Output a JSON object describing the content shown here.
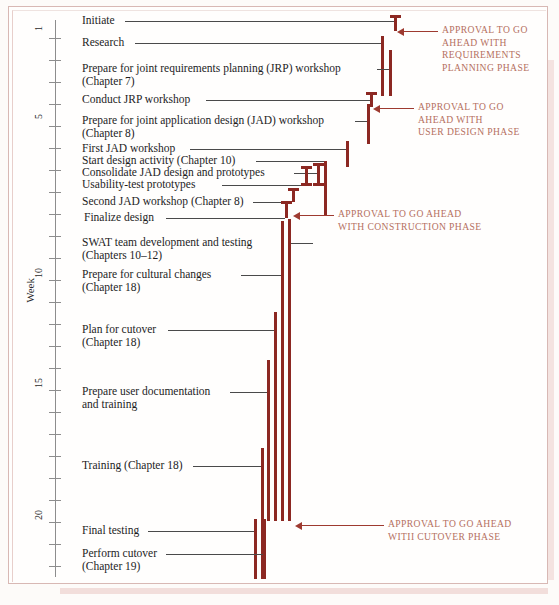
{
  "chart_data": {
    "type": "bar",
    "title": "",
    "xlabel": "",
    "ylabel": "Week",
    "ylim": [
      0,
      23
    ],
    "grid": false,
    "orientation": "vertical-timeline",
    "axis": {
      "label": "Week",
      "tick_labels": [
        "1",
        "5",
        "10",
        "15",
        "20"
      ],
      "tick_values": [
        1,
        5,
        10,
        15,
        20
      ],
      "minor_ticks_every": 1,
      "week_min": 0,
      "week_max": 23
    },
    "bar_color": "#8c2822",
    "leader_color": "#4a4a4a",
    "annotation_color": "#b5705f",
    "categories": [
      "Initiate",
      "Research",
      "Prepare for joint requirements planning (JRP) workshop (Chapter 7)",
      "Conduct JRP workshop",
      "Prepare for joint application design (JAD) workshop (Chapter 8)",
      "First JAD workshop",
      "Start design activity (Chapter 10)",
      "Consolidate JAD design and prototypes",
      "Usability-test prototypes",
      "Second JAD workshop (Chapter 8)",
      "Finalize design",
      "SWAT team development and testing (Chapters 10–12)",
      "Prepare for cultural changes (Chapter 18)",
      "Plan for cutover (Chapter 18)",
      "Prepare user documentation and training",
      "Training (Chapter 18)",
      "Final testing",
      "Perform cutover (Chapter 19)"
    ],
    "tasks": [
      {
        "label": "Initiate",
        "lines": [
          "Initiate"
        ],
        "start_week": 0.6,
        "end_week": 1.1
      },
      {
        "label": "Research",
        "lines": [
          "Research"
        ],
        "start_week": 1.0,
        "end_week": 3.2
      },
      {
        "label": "Prepare for JRP workshop",
        "lines": [
          "Prepare for joint requirements planning (JRP) workshop",
          "(Chapter 7)"
        ],
        "start_week": 1.6,
        "end_week": 3.2
      },
      {
        "label": "Conduct JRP workshop",
        "lines": [
          "Conduct JRP workshop"
        ],
        "start_week": 3.4,
        "end_week": 3.8
      },
      {
        "label": "Prepare for JAD workshop",
        "lines": [
          "Prepare for joint application design (JAD) workshop",
          "(Chapter 8)"
        ],
        "start_week": 3.7,
        "end_week": 5.2
      },
      {
        "label": "First JAD workshop",
        "lines": [
          "First JAD workshop"
        ],
        "start_week": 5.3,
        "end_week": 6.2
      },
      {
        "label": "Start design activity",
        "lines": [
          "Start design activity (Chapter 10)"
        ],
        "start_week": 6.1,
        "end_week": 8.6
      },
      {
        "label": "Consolidate JAD design and prototypes",
        "lines": [
          "Consolidate JAD design and prototypes"
        ],
        "start_week": 6.9,
        "end_week": 7.6
      },
      {
        "label": "Usability-test prototypes",
        "lines": [
          "Usability-test prototypes"
        ],
        "start_week": 7.4,
        "end_week": 7.9
      },
      {
        "label": "Second JAD workshop",
        "lines": [
          "Second JAD workshop (Chapter 8)"
        ],
        "start_week": 8.1,
        "end_week": 8.5
      },
      {
        "label": "Finalize design",
        "lines": [
          "Finalize design"
        ],
        "start_week": 8.3,
        "end_week": 8.8
      },
      {
        "label": "SWAT team development and testing",
        "lines": [
          "SWAT team development and testing",
          "(Chapters 10–12)"
        ],
        "start_week": 8.8,
        "end_week": 21.5
      },
      {
        "label": "Prepare for cultural changes",
        "lines": [
          "Prepare for cultural changes",
          "(Chapter 18)"
        ],
        "start_week": 8.9,
        "end_week": 21.4
      },
      {
        "label": "Plan for cutover",
        "lines": [
          "Plan for cutover",
          "(Chapter 18)"
        ],
        "start_week": 12.9,
        "end_week": 21.4
      },
      {
        "label": "Prepare user documentation and training",
        "lines": [
          "Prepare user documentation",
          "and training"
        ],
        "start_week": 15.1,
        "end_week": 21.4
      },
      {
        "label": "Training",
        "lines": [
          "Training (Chapter 18)"
        ],
        "start_week": 18.6,
        "end_week": 22.9
      },
      {
        "label": "Final testing",
        "lines": [
          "Final testing"
        ],
        "start_week": 21.0,
        "end_week": 22.9
      },
      {
        "label": "Perform cutover",
        "lines": [
          "Perform cutover",
          "(Chapter 19)"
        ],
        "start_week": 21.3,
        "end_week": 22.9
      }
    ],
    "annotations": [
      {
        "id": "requirements-planning",
        "text": "APPROVAL TO GO\nAHEAD WITH\nREQUIREMENTS\nPLANNING PHASE",
        "milestone_week": 1.1
      },
      {
        "id": "user-design",
        "text": "APPROVAL TO GO\nAHEAD WITH\nUSER DESIGN PHASE",
        "milestone_week": 3.8
      },
      {
        "id": "construction",
        "text": "APPROVAL TO GO AHEAD\nWITH CONSTRUCTION PHASE",
        "milestone_week": 8.8
      },
      {
        "id": "cutover",
        "text": "APPROVAL TO GO AHEAD\nWITII CUTOVER PHASE",
        "milestone_week": 21.5
      }
    ]
  },
  "axis": {
    "title": "Week",
    "ticks": [
      {
        "label": "1",
        "y": 38
      },
      {
        "label": "",
        "y": 60
      },
      {
        "label": "",
        "y": 82
      },
      {
        "label": "",
        "y": 104
      },
      {
        "label": "5",
        "y": 126
      },
      {
        "label": "",
        "y": 148
      },
      {
        "label": "",
        "y": 170
      },
      {
        "label": "",
        "y": 192
      },
      {
        "label": "",
        "y": 214
      },
      {
        "label": "",
        "y": 236
      },
      {
        "label": "10",
        "y": 280
      },
      {
        "label": "",
        "y": 258
      },
      {
        "label": "",
        "y": 302
      },
      {
        "label": "",
        "y": 324
      },
      {
        "label": "",
        "y": 346
      },
      {
        "label": "15",
        "y": 390
      },
      {
        "label": "",
        "y": 368
      },
      {
        "label": "",
        "y": 412
      },
      {
        "label": "",
        "y": 434
      },
      {
        "label": "",
        "y": 456
      },
      {
        "label": "",
        "y": 478
      },
      {
        "label": "20",
        "y": 522
      },
      {
        "label": "",
        "y": 500
      },
      {
        "label": "",
        "y": 544
      },
      {
        "label": "",
        "y": 566
      }
    ]
  },
  "tasks": [
    {
      "id": "initiate",
      "lines": [
        "Initiate"
      ],
      "text_x": 82,
      "text_y": 14,
      "leader_x": 125,
      "leader_w": 269,
      "leader_y": 21,
      "bar_x": 394,
      "bar_y": 15,
      "bar_h": 16,
      "cap_top": true,
      "cap_bottom": false
    },
    {
      "id": "research",
      "lines": [
        "Research"
      ],
      "text_x": 82,
      "text_y": 36,
      "leader_x": 135,
      "leader_w": 246,
      "leader_y": 43,
      "bar_x": 381,
      "bar_y": 36,
      "bar_h": 60,
      "cap_top": false,
      "cap_bottom": false
    },
    {
      "id": "prepare-jrp",
      "lines": [
        "Prepare for joint requirements planning (JRP) workshop",
        "(Chapter 7)"
      ],
      "text_x": 82,
      "text_y": 62,
      "leader_x": 377,
      "leader_w": 12,
      "leader_y": 69,
      "bar_x": 389,
      "bar_y": 50,
      "bar_h": 46,
      "cap_top": false,
      "cap_bottom": false
    },
    {
      "id": "conduct-jrp",
      "lines": [
        "Conduct JRP workshop"
      ],
      "text_x": 82,
      "text_y": 93,
      "leader_x": 206,
      "leader_w": 164,
      "leader_y": 100,
      "bar_x": 370,
      "bar_y": 92,
      "bar_h": 15,
      "cap_top": true,
      "cap_bottom": false
    },
    {
      "id": "prepare-jad",
      "lines": [
        "Prepare for joint application design (JAD) workshop",
        "(Chapter 8)"
      ],
      "text_x": 82,
      "text_y": 114,
      "leader_x": 355,
      "leader_w": 12,
      "leader_y": 121,
      "bar_x": 367,
      "bar_y": 104,
      "bar_h": 40,
      "cap_top": false,
      "cap_bottom": false
    },
    {
      "id": "first-jad",
      "lines": [
        "First JAD workshop"
      ],
      "text_x": 82,
      "text_y": 142,
      "leader_x": 190,
      "leader_w": 156,
      "leader_y": 149,
      "bar_x": 346,
      "bar_y": 141,
      "bar_h": 26,
      "cap_top": false,
      "cap_bottom": false
    },
    {
      "id": "start-design",
      "lines": [
        "Start design activity (Chapter 10)"
      ],
      "text_x": 82,
      "text_y": 154,
      "leader_x": 256,
      "leader_w": 68,
      "leader_y": 161,
      "bar_x": 324,
      "bar_y": 161,
      "bar_h": 55,
      "cap_top": false,
      "cap_bottom": false
    },
    {
      "id": "consolidate-jad",
      "lines": [
        "Consolidate JAD design and prototypes"
      ],
      "text_x": 82,
      "text_y": 166,
      "leader_x": 294,
      "leader_w": 23,
      "leader_y": 173,
      "bar_x": 317,
      "bar_y": 163,
      "bar_h": 23,
      "cap_top": true,
      "cap_bottom": true
    },
    {
      "id": "usability-test",
      "lines": [
        "Usability-test prototypes"
      ],
      "text_x": 82,
      "text_y": 178,
      "leader_x": 222,
      "leader_w": 83,
      "leader_y": 185,
      "bar_x": 305,
      "bar_y": 166,
      "bar_h": 20,
      "cap_top": true,
      "cap_bottom": true
    },
    {
      "id": "second-jad",
      "lines": [
        "Second JAD workshop (Chapter 8)"
      ],
      "text_x": 82,
      "text_y": 195,
      "leader_x": 253,
      "leader_w": 39,
      "leader_y": 202,
      "bar_x": 292,
      "bar_y": 188,
      "bar_h": 14,
      "cap_top": true,
      "cap_bottom": false
    },
    {
      "id": "finalize-design",
      "lines": [
        "Finalize design"
      ],
      "text_x": 84,
      "text_y": 211,
      "leader_x": 166,
      "leader_w": 119,
      "leader_y": 218,
      "bar_x": 285,
      "bar_y": 201,
      "bar_h": 17,
      "cap_top": true,
      "cap_bottom": false
    },
    {
      "id": "swat-team",
      "lines": [
        "SWAT team development and testing",
        "(Chapters 10–12)"
      ],
      "text_x": 82,
      "text_y": 236,
      "leader_x": 290,
      "leader_w": 23,
      "leader_y": 243,
      "bar_x": 288,
      "bar_y": 219,
      "bar_h": 302,
      "cap_top": false,
      "cap_bottom": false
    },
    {
      "id": "cultural-changes",
      "lines": [
        "Prepare for cultural changes",
        "(Chapter 18)"
      ],
      "text_x": 82,
      "text_y": 268,
      "leader_x": 241,
      "leader_w": 40,
      "leader_y": 275,
      "bar_x": 281,
      "bar_y": 221,
      "bar_h": 300,
      "cap_top": false,
      "cap_bottom": false
    },
    {
      "id": "plan-cutover",
      "lines": [
        "Plan for cutover",
        "(Chapter 18)"
      ],
      "text_x": 82,
      "text_y": 323,
      "leader_x": 168,
      "leader_w": 106,
      "leader_y": 330,
      "bar_x": 274,
      "bar_y": 312,
      "bar_h": 209,
      "cap_top": false,
      "cap_bottom": false
    },
    {
      "id": "user-documentation",
      "lines": [
        "Prepare user documentation",
        "and training"
      ],
      "text_x": 82,
      "text_y": 385,
      "leader_x": 230,
      "leader_w": 37,
      "leader_y": 392,
      "bar_x": 267,
      "bar_y": 360,
      "bar_h": 161,
      "cap_top": false,
      "cap_bottom": false
    },
    {
      "id": "training",
      "lines": [
        "Training (Chapter 18)"
      ],
      "text_x": 82,
      "text_y": 459,
      "leader_x": 193,
      "leader_w": 68,
      "leader_y": 466,
      "bar_x": 261,
      "bar_y": 448,
      "bar_h": 131,
      "cap_top": false,
      "cap_bottom": false
    },
    {
      "id": "final-testing",
      "lines": [
        "Final testing"
      ],
      "text_x": 82,
      "text_y": 524,
      "leader_x": 148,
      "leader_w": 106,
      "leader_y": 531,
      "bar_x": 254,
      "bar_y": 519,
      "bar_h": 60,
      "cap_top": false,
      "cap_bottom": false
    },
    {
      "id": "perform-cutover",
      "lines": [
        "Perform cutover",
        "(Chapter 19)"
      ],
      "text_x": 82,
      "text_y": 547,
      "leader_x": 166,
      "leader_w": 97,
      "leader_y": 554,
      "bar_x": 263,
      "bar_y": 519,
      "bar_h": 60,
      "cap_top": false,
      "cap_bottom": false
    }
  ],
  "annotations": [
    {
      "id": "approval-requirements",
      "text": "APPROVAL TO GO\nAHEAD WITH\nREQUIREMENTS\nPLANNING PHASE",
      "text_x": 442,
      "text_y": 24,
      "arrow_x": 404,
      "arrow_w": 34,
      "arrow_y": 31,
      "head_x": 397
    },
    {
      "id": "approval-user-design",
      "text": "APPROVAL TO GO\nAHEAD WITH\nUSER DESIGN PHASE",
      "text_x": 418,
      "text_y": 101,
      "arrow_x": 380,
      "arrow_w": 34,
      "arrow_y": 108,
      "head_x": 373
    },
    {
      "id": "approval-construction",
      "text": "APPROVAL TO GO AHEAD\nWITH CONSTRUCTION PHASE",
      "text_x": 338,
      "text_y": 208,
      "arrow_x": 300,
      "arrow_w": 34,
      "arrow_y": 215,
      "head_x": 293
    },
    {
      "id": "approval-cutover",
      "text": "APPROVAL TO GO AHEAD\nWITII CUTOVER PHASE",
      "text_x": 388,
      "text_y": 518,
      "arrow_x": 302,
      "arrow_w": 82,
      "arrow_y": 525,
      "head_x": 295
    }
  ]
}
